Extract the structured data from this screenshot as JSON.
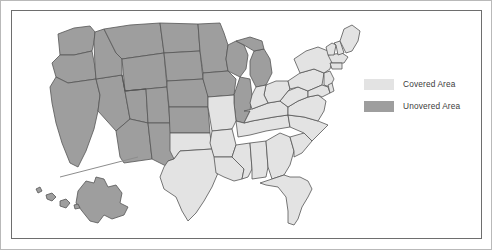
{
  "figure": {
    "type": "choropleth-map",
    "region": "United States",
    "frame_color": "#6e6e6e",
    "background": "#ffffff"
  },
  "legend": {
    "position": "right",
    "items": [
      {
        "label": "Covered Area",
        "color": "#e3e3e3",
        "swatch_name": "legend-swatch-covered"
      },
      {
        "label": "Unovered Area",
        "color": "#9e9e9e",
        "swatch_name": "legend-swatch-unovered"
      }
    ]
  },
  "map_data": {
    "type": "choropleth",
    "categories": [
      "Covered Area",
      "Unovered Area"
    ],
    "colors": {
      "covered": "#e3e3e3",
      "unovered": "#9e9e9e"
    },
    "border_color": "#555555",
    "insets": [
      "Alaska",
      "Hawaii"
    ],
    "regions": {
      "covered": [
        "Texas",
        "Oklahoma",
        "Louisiana",
        "Arkansas",
        "Missouri",
        "Mississippi",
        "Alabama",
        "Georgia",
        "Florida",
        "South Carolina",
        "North Carolina",
        "Tennessee",
        "Kentucky",
        "Virginia",
        "West Virginia",
        "Maryland",
        "Delaware",
        "New Jersey",
        "Pennsylvania",
        "New York",
        "Ohio",
        "Indiana",
        "Connecticut",
        "Rhode Island",
        "Massachusetts",
        "Vermont",
        "New Hampshire",
        "Maine"
      ],
      "unovered": [
        "Washington",
        "Oregon",
        "California",
        "Idaho",
        "Nevada",
        "Utah",
        "Arizona",
        "Montana",
        "Wyoming",
        "Colorado",
        "New Mexico",
        "North Dakota",
        "South Dakota",
        "Nebraska",
        "Kansas",
        "Minnesota",
        "Iowa",
        "Wisconsin",
        "Michigan",
        "Illinois",
        "Alaska",
        "Hawaii"
      ]
    }
  }
}
